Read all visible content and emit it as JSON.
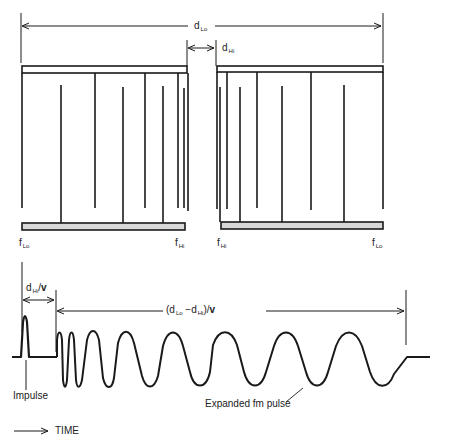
{
  "diagram": {
    "top": {
      "dimension_lo": {
        "main": "d",
        "sub": "Lo"
      },
      "dimension_hi": {
        "main": "d",
        "sub": "Hi"
      },
      "left_transducer": {
        "left_label": {
          "main": "f",
          "sub": "Lo"
        },
        "right_label": {
          "main": "f",
          "sub": "Hi"
        }
      },
      "right_transducer": {
        "left_label": {
          "main": "f",
          "sub": "Hi"
        },
        "right_label": {
          "main": "f",
          "sub": "Lo"
        }
      }
    },
    "bottom": {
      "delay_hi": {
        "main": "d",
        "sub": "Hi",
        "suffix": "/",
        "v": "v"
      },
      "delay_diff": {
        "open": "(d",
        "sub1": "Lo",
        "mid": " −d",
        "sub2": "Hi",
        "close": ")/",
        "v": "v"
      },
      "impulse_label": "Impulse",
      "expanded_label": "Expanded fm pulse",
      "time_label": "TIME"
    },
    "colors": {
      "ink": "#1a1a1a",
      "bar_fill": "#d8d8d8"
    }
  }
}
